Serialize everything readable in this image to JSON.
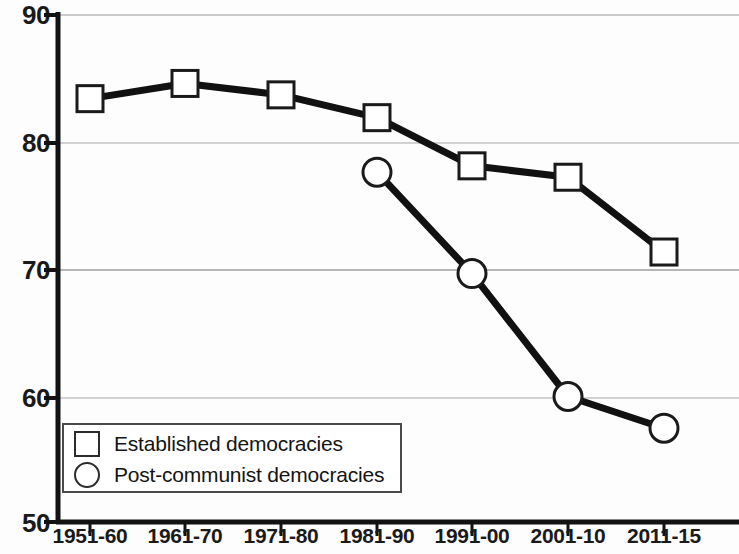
{
  "chart_data": {
    "type": "line",
    "title": "",
    "subtitle": "",
    "xlabel": "",
    "ylabel": "",
    "categories": [
      "1951-60",
      "1961-70",
      "1971-80",
      "1981-90",
      "1991-00",
      "2001-10",
      "2011-15"
    ],
    "ylim": [
      50,
      90
    ],
    "yticks": [
      50,
      60,
      70,
      80,
      90
    ],
    "ytick_labels": [
      "50",
      "60",
      "70",
      "80",
      "90"
    ],
    "grid": true,
    "grid_axis": "y",
    "legend_position": "lower-left-inside",
    "series": [
      {
        "name": "Established democracies",
        "marker": "square",
        "color": "#111111",
        "values": [
          83.4,
          84.6,
          83.7,
          81.9,
          78.1,
          77.2,
          71.3
        ]
      },
      {
        "name": "Post-communist democracies",
        "marker": "circle",
        "color": "#111111",
        "values": [
          null,
          null,
          null,
          77.6,
          69.6,
          59.9,
          57.4
        ]
      }
    ]
  },
  "axis": {
    "y_ticks": [
      "90",
      "80",
      "70",
      "60",
      "50"
    ],
    "x_ticks": [
      "1951-60",
      "1961-70",
      "1971-80",
      "1981-90",
      "1991-00",
      "2001-10",
      "2011-15"
    ]
  },
  "legend": {
    "items": [
      {
        "label": "Established democracies",
        "marker": "square"
      },
      {
        "label": "Post-communist democracies",
        "marker": "circle"
      }
    ]
  }
}
